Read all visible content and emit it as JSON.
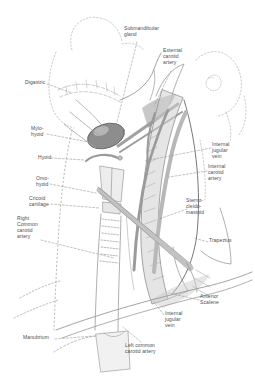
{
  "colors": {
    "background": "#ffffff",
    "sketch_ink": "#8f8f8f",
    "label_text": "#4d4d4d",
    "gland_fill": "#8d8d8d"
  },
  "labels": [
    {
      "id": "submandibular-gland",
      "text": "Submandibular\ngland"
    },
    {
      "id": "external-carotid-artery",
      "text": "External\ncarotid\nartery"
    },
    {
      "id": "digastric",
      "text": "Digastric"
    },
    {
      "id": "mylo-hyoid",
      "text": "Mylo-\nhyoid"
    },
    {
      "id": "hyoid",
      "text": "Hyoid"
    },
    {
      "id": "omo-hyoid",
      "text": "Omo-\nhyoid"
    },
    {
      "id": "cricoid-cartilage",
      "text": "Cricoid\ncartilage"
    },
    {
      "id": "right-common-carotid-artery",
      "text": "Right\nCommon\ncarotid\nartery"
    },
    {
      "id": "manubrium",
      "text": "Manubrium"
    },
    {
      "id": "internal-jugular-vein-upper",
      "text": "Internal\njugular\nvein"
    },
    {
      "id": "internal-carotid-artery",
      "text": "Internal\ncarotid\nartery"
    },
    {
      "id": "sternocleidomastoid",
      "text": "Sterno-\ncleido-\nmastoid"
    },
    {
      "id": "trapezius",
      "text": "Trapezius"
    },
    {
      "id": "anterior-scalene",
      "text": "Anterior\nScalene"
    },
    {
      "id": "internal-jugular-vein-lower",
      "text": "Internal\njugular\nvein"
    },
    {
      "id": "left-common-carotid-artery",
      "text": "Left common\ncarotid artery"
    }
  ]
}
